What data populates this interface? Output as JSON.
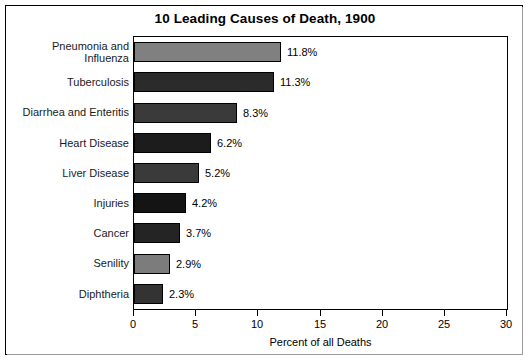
{
  "chart_data": {
    "type": "bar",
    "orientation": "horizontal",
    "title": "10 Leading Causes of Death, 1900",
    "xlabel": "Percent of all Deaths",
    "ylabel": "",
    "xlim": [
      0,
      30
    ],
    "xticks": [
      "0",
      "5",
      "10",
      "15",
      "20",
      "25",
      "30"
    ],
    "xtick_values": [
      0,
      5,
      10,
      15,
      20,
      25,
      30
    ],
    "grid": false,
    "legend": "none",
    "categories": [
      "Pneumonia and Influenza",
      "Tuberculosis",
      "Diarrhea and Enteritis",
      "Heart Disease",
      "Liver Disease",
      "Injuries",
      "Cancer",
      "Senility",
      "Diphtheria"
    ],
    "values": [
      11.8,
      11.3,
      8.3,
      6.2,
      5.2,
      4.2,
      3.7,
      2.9,
      2.3
    ],
    "value_labels": [
      "11.8%",
      "11.3%",
      "8.3%",
      "6.2%",
      "5.2%",
      "4.2%",
      "3.7%",
      "2.9%",
      "2.3%"
    ],
    "bar_colors": [
      "#808080",
      "#2b2b2b",
      "#3a3a3a",
      "#1c1c1c",
      "#3a3a3a",
      "#141414",
      "#242424",
      "#7c7c7c",
      "#333333"
    ]
  },
  "figure": {
    "background": "#ffffff",
    "frame_color": "#000000",
    "text_color": "#000000"
  },
  "category_label_lines": [
    [
      "Pneumonia and",
      "Influenza"
    ],
    [
      "Tuberculosis"
    ],
    [
      "Diarrhea and Enteritis"
    ],
    [
      "Heart Disease"
    ],
    [
      "Liver Disease"
    ],
    [
      "Injuries"
    ],
    [
      "Cancer"
    ],
    [
      "Senility"
    ],
    [
      "Diphtheria"
    ]
  ]
}
